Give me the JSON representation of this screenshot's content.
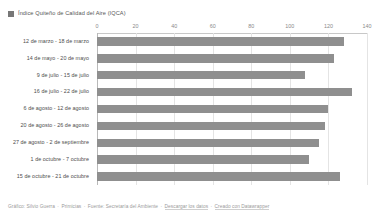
{
  "legend": {
    "swatch_color": "#777777",
    "label": "Índice Quiteño de Calidad del Aire (IQCA)"
  },
  "footer": {
    "author_prefix": "Gráfico: Silvio Guerra",
    "publisher": "Primicias",
    "source": "Fuente: Secretaría del Ambiente",
    "download": "Descargar los datos",
    "created_with": "Creado con Datawrapper",
    "separator": "·"
  },
  "chart_data": {
    "type": "bar",
    "orientation": "horizontal",
    "title": "",
    "subtitle": "",
    "xlabel": "",
    "ylabel": "",
    "xlim": [
      0,
      140
    ],
    "ticks": [
      0,
      20,
      40,
      60,
      80,
      100,
      120,
      140
    ],
    "tick_labels": [
      "0",
      "20",
      "40",
      "60",
      "80",
      "100",
      "120",
      "140"
    ],
    "grid": true,
    "legend_position": "top-left",
    "bar_color": "#8f8f8f",
    "series_name": "Índice Quiteño de Calidad del Aire (IQCA)",
    "categories": [
      "12 de marzo - 18 de marzo",
      "14 de mayo - 20 de mayo",
      "9 de julio - 15 de julio",
      "16 de julio - 22 de julio",
      "6 de agosto - 12 de agosto",
      "20 de agosto - 26 de agosto",
      "27 de agosto - 2 de septiembre",
      "1 de octubre - 7 octubre",
      "15 de octubre - 21 de octubre"
    ],
    "values": [
      128,
      123,
      108,
      132,
      120,
      118,
      115,
      110,
      126
    ]
  }
}
